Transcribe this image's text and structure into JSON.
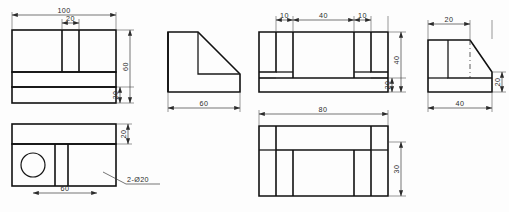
{
  "drawing": {
    "title": "Orthographic multiview engineering drawing",
    "background_color": "#fdfdfd",
    "line_color": "#111111",
    "dimension_color": "#3a3a3a"
  },
  "views": {
    "front": {
      "name": "front-view",
      "dimensions": {
        "overall_width": "100",
        "slot_width": "20",
        "overall_height": "60",
        "base_height": "20"
      }
    },
    "side_profile": {
      "name": "side-profile-view",
      "dimensions": {
        "width": "60"
      }
    },
    "top": {
      "name": "top-view",
      "dimensions": {
        "hole_spacing": "60",
        "base_depth": "20",
        "holes_note": "2-Ø20"
      }
    },
    "rear": {
      "name": "rear-view",
      "dimensions": {
        "left_step": "10",
        "center_span": "40",
        "right_step": "10",
        "overall_height": "40",
        "base_height": "20"
      }
    },
    "bottom": {
      "name": "bottom-view",
      "dimensions": {
        "overall_width": "80",
        "height": "30"
      }
    },
    "right": {
      "name": "right-side-view",
      "dimensions": {
        "top_flat": "20",
        "overall_width": "40",
        "right_height": "20"
      }
    }
  },
  "labels": {
    "d100": "100",
    "d20a": "20",
    "d60a": "60",
    "d20b": "20",
    "d60b": "60",
    "d60c": "60",
    "d20c": "20",
    "hole_callout": "2-Ø20",
    "d10a": "10",
    "d40a": "40",
    "d10b": "10",
    "d40b": "40",
    "d20d": "20",
    "d80": "80",
    "d30": "30",
    "d20e": "20",
    "d40c": "40",
    "d20f": "20"
  }
}
